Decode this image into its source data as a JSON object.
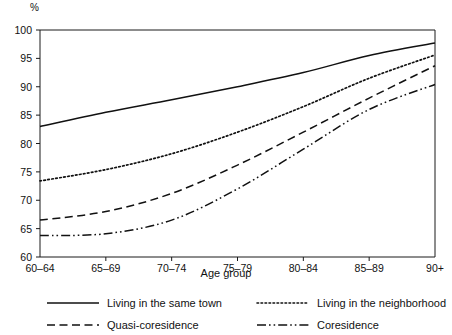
{
  "axis": {
    "y_unit_label": "%",
    "x_title": "Age group",
    "y_ticks": [
      "100",
      "95",
      "90",
      "85",
      "80",
      "75",
      "70",
      "65",
      "60"
    ],
    "x_ticks": [
      "60–64",
      "65–69",
      "70–74",
      "75–79",
      "80–84",
      "85–89",
      "90+"
    ]
  },
  "legend": {
    "items": [
      {
        "label": "Living in the same town",
        "style": "solid"
      },
      {
        "label": "Living in the neighborhood",
        "style": "dotted"
      },
      {
        "label": "Quasi-coresidence",
        "style": "dashed"
      },
      {
        "label": "Coresidence",
        "style": "dashdot"
      }
    ]
  },
  "chart_data": {
    "type": "line",
    "title": "",
    "xlabel": "Age group",
    "ylabel": "%",
    "ylim": [
      60,
      100
    ],
    "grid": false,
    "legend_position": "bottom",
    "categories": [
      "60-64",
      "65-69",
      "70-74",
      "75-79",
      "80-84",
      "85-89",
      "90+"
    ],
    "series": [
      {
        "name": "Living in the same town",
        "style": "solid",
        "color": "#111111",
        "values": [
          83.0,
          85.5,
          87.7,
          90.0,
          92.5,
          95.5,
          97.7
        ]
      },
      {
        "name": "Living in the neighborhood",
        "style": "dotted",
        "color": "#111111",
        "values": [
          73.4,
          75.4,
          78.2,
          82.0,
          86.5,
          91.5,
          95.6
        ]
      },
      {
        "name": "Quasi-coresidence",
        "style": "dashed",
        "color": "#111111",
        "values": [
          66.5,
          68.0,
          71.2,
          76.2,
          82.0,
          88.0,
          93.7
        ]
      },
      {
        "name": "Coresidence",
        "style": "dashdot",
        "color": "#111111",
        "values": [
          63.8,
          64.1,
          66.5,
          72.0,
          79.0,
          86.0,
          90.4
        ]
      }
    ]
  }
}
